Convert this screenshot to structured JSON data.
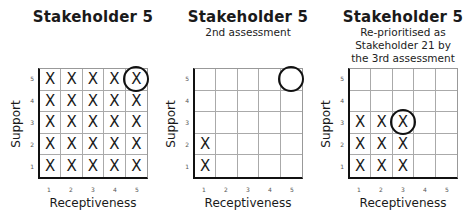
{
  "panels": [
    {
      "title": "Stakeholder 5",
      "subtitle": [],
      "xlabel": "Receptiveness",
      "ylabel": "Support",
      "x_ticks": [
        "1",
        "2",
        "3",
        "4",
        "5"
      ],
      "y_ticks": [
        "5",
        "4",
        "3",
        "2",
        "1"
      ],
      "marks": "X",
      "filled_cells": [
        [
          1,
          1
        ],
        [
          2,
          1
        ],
        [
          3,
          1
        ],
        [
          4,
          1
        ],
        [
          5,
          1
        ],
        [
          1,
          2
        ],
        [
          2,
          2
        ],
        [
          3,
          2
        ],
        [
          4,
          2
        ],
        [
          5,
          2
        ],
        [
          1,
          3
        ],
        [
          2,
          3
        ],
        [
          3,
          3
        ],
        [
          4,
          3
        ],
        [
          5,
          3
        ],
        [
          1,
          4
        ],
        [
          2,
          4
        ],
        [
          3,
          4
        ],
        [
          4,
          4
        ],
        [
          5,
          4
        ],
        [
          1,
          5
        ],
        [
          2,
          5
        ],
        [
          3,
          5
        ],
        [
          4,
          5
        ],
        [
          5,
          5
        ]
      ],
      "circled_cell": [
        5,
        5
      ]
    },
    {
      "title": "Stakeholder 5",
      "subtitle": [
        "2nd assessment"
      ],
      "xlabel": "Receptiveness",
      "ylabel": "Support",
      "x_ticks": [
        "1",
        "2",
        "3",
        "4",
        "5"
      ],
      "y_ticks": [
        "5",
        "4",
        "3",
        "2",
        "1"
      ],
      "marks": "X",
      "filled_cells": [
        [
          1,
          1
        ],
        [
          1,
          2
        ]
      ],
      "circled_cell": [
        5,
        5
      ]
    },
    {
      "title": "Stakeholder 5",
      "subtitle": [
        "Re-prioritised as",
        "Stakeholder 21 by",
        "the 3rd assessment"
      ],
      "xlabel": "Receptiveness",
      "ylabel": "Support",
      "x_ticks": [
        "1",
        "2",
        "3",
        "4",
        "5"
      ],
      "y_ticks": [
        "5",
        "4",
        "3",
        "2",
        "1"
      ],
      "marks": "X",
      "filled_cells": [
        [
          1,
          1
        ],
        [
          2,
          1
        ],
        [
          3,
          1
        ],
        [
          1,
          2
        ],
        [
          2,
          2
        ],
        [
          3,
          2
        ],
        [
          1,
          3
        ],
        [
          2,
          3
        ],
        [
          3,
          3
        ]
      ],
      "circled_cell": [
        3,
        3
      ]
    }
  ]
}
